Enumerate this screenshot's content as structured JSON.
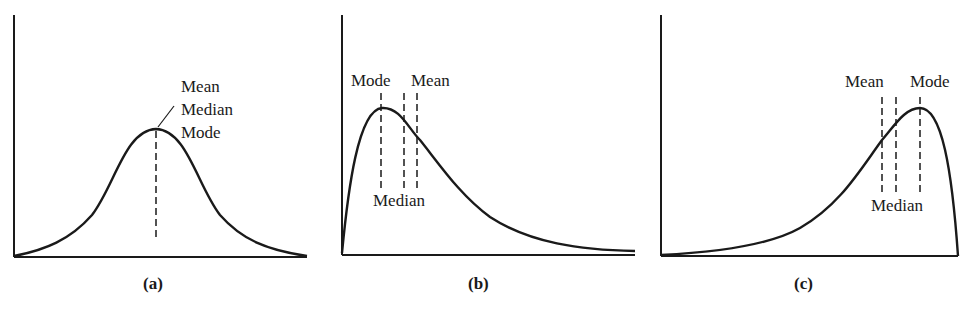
{
  "figure": {
    "panels": [
      {
        "id": "a",
        "caption": "(a)",
        "shape": "symmetric",
        "labels": {
          "mean": "Mean",
          "median": "Median",
          "mode": "Mode"
        }
      },
      {
        "id": "b",
        "caption": "(b)",
        "shape": "right-skewed (positive skew)",
        "labels": {
          "mode": "Mode",
          "mean": "Mean",
          "median": "Median"
        }
      },
      {
        "id": "c",
        "caption": "(c)",
        "shape": "left-skewed (negative skew)",
        "labels": {
          "mean": "Mean",
          "mode": "Mode",
          "median": "Median"
        }
      }
    ],
    "colors": {
      "ink": "#1a1a1a",
      "background": "#ffffff"
    }
  }
}
